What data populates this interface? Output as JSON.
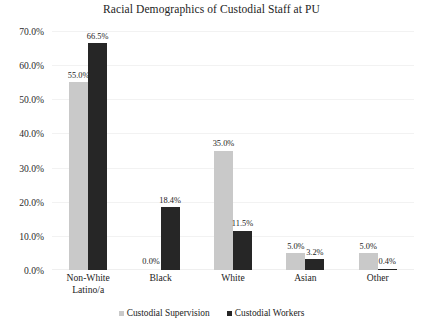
{
  "chart_data": {
    "type": "bar",
    "title": "Racial Demographics of Custodial Staff at PU",
    "xlabel": "",
    "ylabel": "",
    "ylim": [
      0,
      70
    ],
    "ytick_step": 10,
    "grid": true,
    "legend_position": "bottom",
    "categories": [
      "Non-White Latino/a",
      "Black",
      "White",
      "Asian",
      "Other"
    ],
    "category_lines": [
      [
        "Non-White",
        "Latino/a"
      ],
      [
        "Black"
      ],
      [
        "White"
      ],
      [
        "Asian"
      ],
      [
        "Other"
      ]
    ],
    "ytick_labels": [
      "70.0%",
      "60.0%",
      "50.0%",
      "40.0%",
      "30.0%",
      "20.0%",
      "10.0%",
      "0.0%"
    ],
    "ytick_values": [
      70,
      60,
      50,
      40,
      30,
      20,
      10,
      0
    ],
    "series": [
      {
        "name": "Custodial Supervision",
        "color": "#c9c9c9",
        "values": [
          55.0,
          0.0,
          35.0,
          5.0,
          5.0
        ],
        "labels": [
          "55.0%",
          "0.0%",
          "35.0%",
          "5.0%",
          "5.0%"
        ]
      },
      {
        "name": "Custodial Workers",
        "color": "#262626",
        "values": [
          66.5,
          18.4,
          11.5,
          3.2,
          0.4
        ],
        "labels": [
          "66.5%",
          "18.4%",
          "11.5%",
          "3.2%",
          "0.4%"
        ]
      }
    ]
  },
  "legend": {
    "items": [
      {
        "label": "Custodial Supervision",
        "swatch": "supervision"
      },
      {
        "label": "Custodial Workers",
        "swatch": "workers"
      }
    ]
  }
}
